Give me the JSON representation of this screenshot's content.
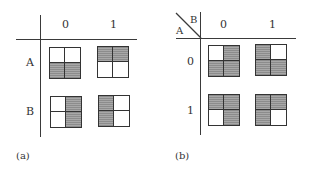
{
  "panels": [
    {
      "caption": "(a)",
      "col_header_labels": [
        "0",
        "1"
      ],
      "row_header_labels": [
        "A",
        "B"
      ],
      "corner": null,
      "cells": [
        {
          "row": "A",
          "col": "0",
          "shaded_quadrants": [
            "bottom-left",
            "bottom-right"
          ]
        },
        {
          "row": "A",
          "col": "1",
          "shaded_quadrants": [
            "top-left",
            "top-right"
          ]
        },
        {
          "row": "B",
          "col": "0",
          "shaded_quadrants": [
            "top-right",
            "bottom-right"
          ]
        },
        {
          "row": "B",
          "col": "1",
          "shaded_quadrants": [
            "top-left",
            "bottom-left"
          ]
        }
      ]
    },
    {
      "caption": "(b)",
      "col_header_labels": [
        "0",
        "1"
      ],
      "row_header_labels": [
        "0",
        "1"
      ],
      "corner": {
        "col_var": "B",
        "row_var": "A"
      },
      "cells": [
        {
          "row": "0",
          "col": "0",
          "shaded_quadrants": [
            "top-right",
            "bottom-left",
            "bottom-right"
          ]
        },
        {
          "row": "0",
          "col": "1",
          "shaded_quadrants": [
            "top-left",
            "bottom-left",
            "bottom-right"
          ]
        },
        {
          "row": "1",
          "col": "0",
          "shaded_quadrants": [
            "top-left",
            "top-right",
            "bottom-right"
          ]
        },
        {
          "row": "1",
          "col": "1",
          "shaded_quadrants": [
            "top-left",
            "top-right",
            "bottom-left"
          ]
        }
      ]
    }
  ],
  "colors": {
    "line": "#3a3a3a",
    "shade": "#9a9a9a",
    "background": "#ffffff"
  }
}
